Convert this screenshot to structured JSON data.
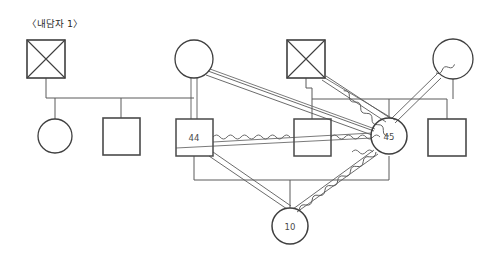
{
  "diagram": {
    "title": "〈내담자 1〉",
    "title_position": {
      "x": 27,
      "y": 27
    },
    "type": "genogram",
    "canvas": {
      "width": 501,
      "height": 259,
      "background": "#ffffff"
    },
    "colors": {
      "stroke": "#4d4d4d",
      "stroke_light": "#7a7a7a",
      "text": "#4a4a4a",
      "title_text": "#2b2b2b"
    },
    "nodes": [
      {
        "id": "n1",
        "shape": "square",
        "deceased": true,
        "label": "",
        "cx": 46,
        "cy": 59,
        "size": 38,
        "gender": "male",
        "generation": 1
      },
      {
        "id": "n2",
        "shape": "circle",
        "deceased": false,
        "label": "",
        "cx": 194,
        "cy": 59,
        "r": 19,
        "gender": "female",
        "generation": 1
      },
      {
        "id": "n3",
        "shape": "square",
        "deceased": true,
        "label": "",
        "cx": 306,
        "cy": 59,
        "size": 38,
        "gender": "male",
        "generation": 1
      },
      {
        "id": "n4",
        "shape": "circle",
        "deceased": false,
        "label": "",
        "cx": 453,
        "cy": 59,
        "r": 20,
        "gender": "female",
        "generation": 1
      },
      {
        "id": "n5",
        "shape": "circle",
        "deceased": false,
        "label": "",
        "cx": 55,
        "cy": 136,
        "r": 17,
        "gender": "female",
        "generation": 2
      },
      {
        "id": "n6",
        "shape": "square",
        "deceased": false,
        "label": "",
        "cx": 121,
        "cy": 136,
        "size": 37,
        "gender": "male",
        "generation": 2
      },
      {
        "id": "n7",
        "shape": "square",
        "deceased": false,
        "label": "44",
        "cx": 194,
        "cy": 137,
        "size": 37,
        "gender": "male",
        "generation": 2
      },
      {
        "id": "n8",
        "shape": "square",
        "deceased": false,
        "label": "",
        "cx": 312,
        "cy": 137,
        "size": 37,
        "gender": "male",
        "generation": 2
      },
      {
        "id": "n9",
        "shape": "circle",
        "deceased": false,
        "label": "45",
        "cx": 389,
        "cy": 136,
        "r": 18,
        "gender": "female",
        "generation": 2
      },
      {
        "id": "n10",
        "shape": "square",
        "deceased": false,
        "label": "",
        "cx": 447,
        "cy": 137,
        "size": 38,
        "gender": "male",
        "generation": 2
      },
      {
        "id": "n11",
        "shape": "circle",
        "deceased": false,
        "label": "10",
        "cx": 290,
        "cy": 226,
        "r": 18,
        "gender": "female",
        "generation": 3
      }
    ],
    "labels": [
      {
        "node": "n7",
        "text": "44"
      },
      {
        "node": "n9",
        "text": "45"
      },
      {
        "node": "n11",
        "text": "10"
      }
    ],
    "relationships": [
      {
        "kind": "conflictual-wavy",
        "from": "n7",
        "to": "n8",
        "note": "44 to sibling square"
      },
      {
        "kind": "conflictual-wavy",
        "from": "n8",
        "to": "n9",
        "note": "square to 45"
      },
      {
        "kind": "conflictual-wavy",
        "from": "n4",
        "to": "n9",
        "note": "mother to 45"
      },
      {
        "kind": "conflictual-wavy",
        "from": "n9",
        "to": "n11",
        "note": "45 to child 10"
      },
      {
        "kind": "close-double",
        "from": "n2",
        "to": "n7",
        "note": "mother to 44"
      },
      {
        "kind": "close-double",
        "from": "n7",
        "to": "n11",
        "note": "44 to child 10"
      },
      {
        "kind": "close-double",
        "from": "n2",
        "to": "n9",
        "note": "mother to 45 diagonal"
      },
      {
        "kind": "close-double",
        "from": "n3",
        "to": "n9",
        "note": "deceased father to 45"
      },
      {
        "kind": "single-diagonal",
        "from": "n2",
        "to": "n9",
        "note": "long diagonal"
      },
      {
        "kind": "single-diagonal",
        "from": "n3",
        "to": "n9",
        "note": "diagonal"
      },
      {
        "kind": "single-diagonal",
        "from": "n7",
        "to": "n9",
        "note": "cross link"
      }
    ],
    "family_structures": [
      {
        "name": "left-family",
        "parent_bar_y": 98,
        "bar_x1": 46,
        "bar_x2": 194,
        "children_x": [
          55,
          121,
          194
        ]
      },
      {
        "name": "right-family",
        "parent_bar_y": 99,
        "bar_x1": 312,
        "bar_x2": 447,
        "children_x": [
          312,
          389,
          447
        ]
      },
      {
        "name": "bottom-family",
        "parent_bar_y": 180,
        "bar_x1": 194,
        "bar_x2": 389,
        "children_x": [
          290
        ]
      }
    ]
  }
}
